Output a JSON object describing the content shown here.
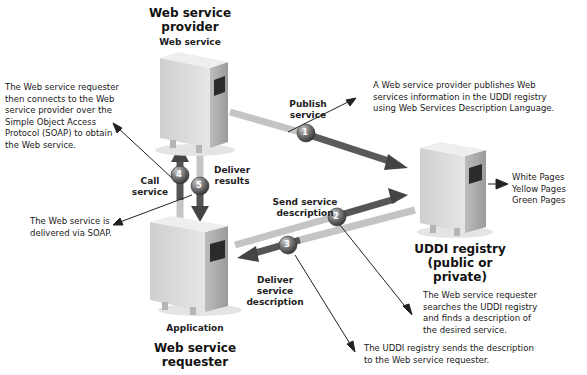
{
  "provider": {
    "title_line1": "Web service",
    "title_line2": "provider",
    "subtitle": "Web service"
  },
  "requester": {
    "subtitle": "Application",
    "title_line1": "Web service",
    "title_line2": "requester"
  },
  "registry": {
    "title_line1": "UDDI registry",
    "title_line2": "(public or private)",
    "pages": [
      "White Pages",
      "Yellow Pages",
      "Green Pages"
    ]
  },
  "steps": [
    {
      "number": "1",
      "label_line1": "Publish",
      "label_line2": "service"
    },
    {
      "number": "2",
      "label_line1": "Send service",
      "label_line2": "description"
    },
    {
      "number": "3",
      "label_line1": "Deliver",
      "label_line2": "service",
      "label_line3": "description"
    },
    {
      "number": "4",
      "label_line1": "Call",
      "label_line2": "service"
    },
    {
      "number": "5",
      "label_line1": "Deliver",
      "label_line2": "results"
    }
  ],
  "notes": {
    "publish": [
      "A Web service provider publishes Web",
      "services information in the UDDI registry",
      "using Web Services Description Language."
    ],
    "connect": [
      "The Web service requester",
      "then connects to the Web",
      "service provider over the",
      "Simple Object Access",
      "Protocol (SOAP) to obtain",
      "the Web service."
    ],
    "delivered": [
      "The Web service is",
      "delivered via SOAP."
    ],
    "search": [
      "The Web service requester",
      "searches the UDDI registry",
      "and finds a description of",
      "the desired service."
    ],
    "send": [
      "The UDDI registry sends the description",
      "to the Web service requester."
    ]
  },
  "colors": {
    "arrow_dark": "#4a4a4a",
    "arrow_light": "#b8b8b8",
    "server_body": "#d9d9d9",
    "circle": "#6e6e6e"
  }
}
